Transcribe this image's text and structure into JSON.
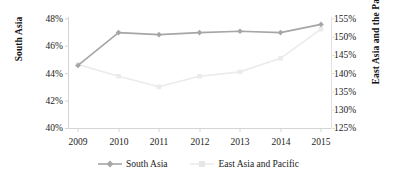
{
  "chart_data": {
    "type": "line",
    "title": "",
    "xlabel": "",
    "grid": false,
    "legend_position": "bottom",
    "categories": [
      "2009",
      "2010",
      "2011",
      "2012",
      "2013",
      "2014",
      "2015"
    ],
    "x_tick_labels": [
      "2009",
      "2010",
      "2011",
      "2012",
      "2013",
      "2014",
      "2015"
    ],
    "left_axis": {
      "label": "South Asia",
      "ylim": [
        40,
        48
      ],
      "tick_labels": [
        "48%",
        "46%",
        "44%",
        "42%",
        "40%"
      ],
      "tick_values": [
        48,
        46,
        44,
        42,
        40
      ],
      "format": "percent"
    },
    "right_axis": {
      "label": "East Asia and the Pacific",
      "ylim": [
        125,
        155
      ],
      "tick_labels": [
        "155%",
        "150%",
        "145%",
        "140%",
        "135%",
        "130%",
        "125%"
      ],
      "tick_values": [
        155,
        150,
        145,
        140,
        135,
        130,
        125
      ],
      "format": "percent"
    },
    "series": [
      {
        "name": "South Asia",
        "legend_label": "South Asia",
        "axis": "left",
        "color": "#a6a6a6",
        "marker": "diamond",
        "values": [
          44.6,
          47.0,
          46.85,
          47.0,
          47.1,
          47.0,
          47.6
        ]
      },
      {
        "name": "East Asia and Pacific",
        "legend_label": "East Asia and Pacific",
        "axis": "right",
        "color": "#ebebeb",
        "marker": "square",
        "values": [
          142.5,
          139.3,
          136.4,
          139.3,
          140.5,
          144.2,
          152.2
        ]
      }
    ]
  },
  "legend": {
    "items": [
      {
        "label": "South Asia",
        "color": "#a6a6a6",
        "marker": "diamond"
      },
      {
        "label": "East Asia and Pacific",
        "color": "#e6e6e6",
        "marker": "square"
      }
    ]
  },
  "colors": {
    "south_asia": "#a6a6a6",
    "east_asia": "#ebebeb",
    "axis": "#d0d0d0",
    "text": "#1a1a1a"
  }
}
